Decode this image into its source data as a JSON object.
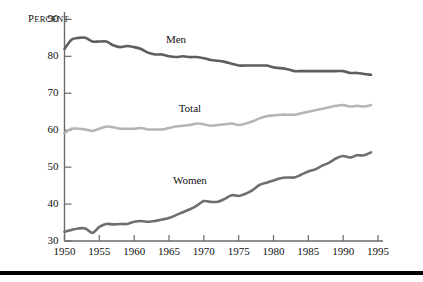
{
  "chart_data": {
    "type": "line",
    "title": "",
    "subtitle": "",
    "xlabel": "",
    "ylabel": "Percent",
    "ylabel_display": "PERCENT",
    "xlim": [
      1950,
      1995
    ],
    "ylim": [
      30,
      92
    ],
    "grid": false,
    "legend_position": "inline-labels",
    "y_ticks": [
      30,
      40,
      50,
      60,
      70,
      80,
      90
    ],
    "y_tick_labels": [
      "30",
      "40",
      "50",
      "60",
      "70",
      "80",
      "90"
    ],
    "x_ticks": [
      1950,
      1955,
      1960,
      1965,
      1970,
      1975,
      1980,
      1985,
      1990,
      1995
    ],
    "x_tick_labels": [
      "1950",
      "1955",
      "1960",
      "1965",
      "1970",
      "1975",
      "1980",
      "1985",
      "1990",
      "1995"
    ],
    "x": [
      1950,
      1951,
      1952,
      1953,
      1954,
      1955,
      1956,
      1957,
      1958,
      1959,
      1960,
      1961,
      1962,
      1963,
      1964,
      1965,
      1966,
      1967,
      1968,
      1969,
      1970,
      1971,
      1972,
      1973,
      1974,
      1975,
      1976,
      1977,
      1978,
      1979,
      1980,
      1981,
      1982,
      1983,
      1984,
      1985,
      1986,
      1987,
      1988,
      1989,
      1990,
      1991,
      1992,
      1993,
      1994
    ],
    "series": [
      {
        "name": "Men",
        "label": "Men",
        "color": "#5e5e5e",
        "label_x": 1966,
        "label_y": 83.5,
        "values": [
          82.0,
          84.5,
          85.0,
          85.0,
          84.0,
          84.0,
          84.0,
          83.0,
          82.5,
          82.8,
          82.5,
          82.0,
          81.0,
          80.5,
          80.5,
          80.0,
          79.8,
          80.0,
          79.8,
          79.8,
          79.5,
          79.0,
          78.8,
          78.5,
          78.0,
          77.5,
          77.5,
          77.5,
          77.5,
          77.5,
          77.0,
          76.8,
          76.5,
          76.0,
          76.0,
          76.0,
          76.0,
          76.0,
          76.0,
          76.0,
          76.0,
          75.5,
          75.5,
          75.2,
          75.0
        ]
      },
      {
        "name": "Total",
        "label": "Total",
        "color": "#b5b5b5",
        "label_x": 1968,
        "label_y": 65.0,
        "values": [
          59.2,
          60.4,
          60.4,
          60.2,
          59.8,
          60.4,
          61.0,
          60.8,
          60.4,
          60.4,
          60.4,
          60.6,
          60.2,
          60.2,
          60.2,
          60.6,
          61.0,
          61.2,
          61.4,
          61.8,
          61.6,
          61.2,
          61.4,
          61.6,
          61.8,
          61.4,
          61.8,
          62.4,
          63.2,
          63.8,
          64.0,
          64.2,
          64.2,
          64.2,
          64.6,
          65.0,
          65.4,
          65.8,
          66.2,
          66.6,
          66.8,
          66.4,
          66.6,
          66.4,
          66.8
        ]
      },
      {
        "name": "Women",
        "label": "Women",
        "color": "#6e6e6e",
        "label_x": 1968,
        "label_y": 45.5,
        "values": [
          32.5,
          33.0,
          33.4,
          33.4,
          32.2,
          33.8,
          34.6,
          34.5,
          34.6,
          34.6,
          35.2,
          35.4,
          35.2,
          35.4,
          35.8,
          36.2,
          37.0,
          37.8,
          38.6,
          39.6,
          40.8,
          40.6,
          40.6,
          41.4,
          42.4,
          42.2,
          42.8,
          43.8,
          45.2,
          45.8,
          46.4,
          47.0,
          47.2,
          47.2,
          48.0,
          48.8,
          49.4,
          50.4,
          51.2,
          52.4,
          53.0,
          52.6,
          53.2,
          53.2,
          54.0
        ]
      }
    ]
  },
  "axes": {
    "y_axis_title": "PERCENT",
    "y_axis_title_first": "P",
    "y_axis_title_rest": "ERCENT"
  }
}
